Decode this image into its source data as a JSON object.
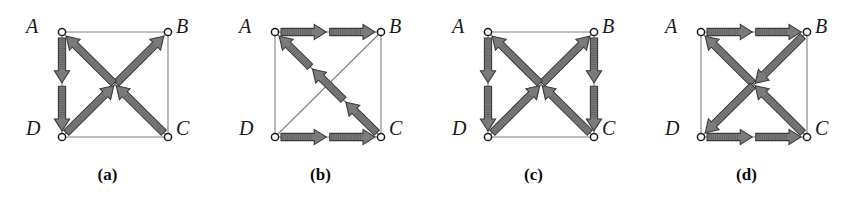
{
  "figure": {
    "background_color": "#ffffff",
    "arrow_fill_color": "#7b7b7b",
    "arrow_stroke_color": "#3a3a3a",
    "edge_color": "#808080",
    "node_fill_color": "#ffffff",
    "node_stroke_color": "#1a1a1a",
    "label_color": "#1a1a1a",
    "node_labels": {
      "A": "A",
      "B": "B",
      "C": "C",
      "D": "D"
    },
    "panels": [
      {
        "id": "a",
        "caption": "(a)",
        "nodes": [
          {
            "name": "A",
            "label": "A",
            "x": 62,
            "y": 32
          },
          {
            "name": "B",
            "label": "B",
            "x": 168,
            "y": 32
          },
          {
            "name": "C",
            "label": "C",
            "x": 168,
            "y": 137
          },
          {
            "name": "D",
            "label": "D",
            "x": 62,
            "y": 137
          }
        ],
        "edges": [
          {
            "name": "edge-A-B",
            "from": "A",
            "to": "B",
            "arrows": 0,
            "direction": "none"
          },
          {
            "name": "edge-B-C",
            "from": "B",
            "to": "C",
            "arrows": 0,
            "direction": "none"
          },
          {
            "name": "edge-D-C",
            "from": "D",
            "to": "C",
            "arrows": 0,
            "direction": "none"
          },
          {
            "name": "edge-A-D",
            "from": "A",
            "to": "D",
            "arrows": 2,
            "direction": "A-to-D"
          },
          {
            "name": "edge-D-B",
            "from": "D",
            "to": "B",
            "arrows": 2,
            "direction": "D-to-B"
          },
          {
            "name": "edge-C-A",
            "from": "C",
            "to": "A",
            "arrows": 2,
            "direction": "C-to-A"
          }
        ]
      },
      {
        "id": "b",
        "caption": "(b)",
        "nodes": [
          {
            "name": "A",
            "label": "A",
            "x": 62,
            "y": 32
          },
          {
            "name": "B",
            "label": "B",
            "x": 168,
            "y": 32
          },
          {
            "name": "C",
            "label": "C",
            "x": 168,
            "y": 137
          },
          {
            "name": "D",
            "label": "D",
            "x": 62,
            "y": 137
          }
        ],
        "edges": [
          {
            "name": "edge-A-D",
            "from": "A",
            "to": "D",
            "arrows": 0,
            "direction": "none"
          },
          {
            "name": "edge-B-C",
            "from": "B",
            "to": "C",
            "arrows": 0,
            "direction": "none"
          },
          {
            "name": "edge-D-B",
            "from": "D",
            "to": "B",
            "arrows": 0,
            "direction": "none"
          },
          {
            "name": "edge-A-B",
            "from": "A",
            "to": "B",
            "arrows": 2,
            "direction": "A-to-B"
          },
          {
            "name": "edge-D-C",
            "from": "D",
            "to": "C",
            "arrows": 2,
            "direction": "D-to-C"
          },
          {
            "name": "edge-C-A",
            "from": "C",
            "to": "A",
            "arrows": 3,
            "direction": "C-to-A"
          }
        ]
      },
      {
        "id": "c",
        "caption": "(c)",
        "nodes": [
          {
            "name": "A",
            "label": "A",
            "x": 62,
            "y": 32
          },
          {
            "name": "B",
            "label": "B",
            "x": 168,
            "y": 32
          },
          {
            "name": "C",
            "label": "C",
            "x": 168,
            "y": 137
          },
          {
            "name": "D",
            "label": "D",
            "x": 62,
            "y": 137
          }
        ],
        "edges": [
          {
            "name": "edge-A-B",
            "from": "A",
            "to": "B",
            "arrows": 0,
            "direction": "none"
          },
          {
            "name": "edge-D-C",
            "from": "D",
            "to": "C",
            "arrows": 0,
            "direction": "none"
          },
          {
            "name": "edge-A-D",
            "from": "A",
            "to": "D",
            "arrows": 2,
            "direction": "A-to-D"
          },
          {
            "name": "edge-B-C",
            "from": "B",
            "to": "C",
            "arrows": 2,
            "direction": "B-to-C"
          },
          {
            "name": "edge-D-B",
            "from": "D",
            "to": "B",
            "arrows": 2,
            "direction": "D-to-B"
          },
          {
            "name": "edge-C-A",
            "from": "C",
            "to": "A",
            "arrows": 2,
            "direction": "C-to-A"
          }
        ]
      },
      {
        "id": "d",
        "caption": "(d)",
        "nodes": [
          {
            "name": "A",
            "label": "A",
            "x": 62,
            "y": 32
          },
          {
            "name": "B",
            "label": "B",
            "x": 168,
            "y": 32
          },
          {
            "name": "C",
            "label": "C",
            "x": 168,
            "y": 137
          },
          {
            "name": "D",
            "label": "D",
            "x": 62,
            "y": 137
          }
        ],
        "edges": [
          {
            "name": "edge-A-D",
            "from": "A",
            "to": "D",
            "arrows": 0,
            "direction": "none"
          },
          {
            "name": "edge-B-C",
            "from": "B",
            "to": "C",
            "arrows": 0,
            "direction": "none"
          },
          {
            "name": "edge-A-B",
            "from": "A",
            "to": "B",
            "arrows": 2,
            "direction": "A-to-B"
          },
          {
            "name": "edge-D-C",
            "from": "D",
            "to": "C",
            "arrows": 2,
            "direction": "D-to-C"
          },
          {
            "name": "edge-C-A",
            "from": "C",
            "to": "A",
            "arrows": 2,
            "direction": "C-to-A"
          },
          {
            "name": "edge-B-D",
            "from": "B",
            "to": "D",
            "arrows": 2,
            "direction": "B-to-D"
          }
        ]
      }
    ]
  }
}
